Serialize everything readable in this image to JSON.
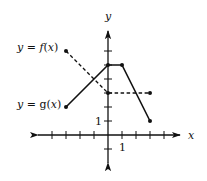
{
  "figure": {
    "axes": {
      "x_label": "x",
      "y_label": "y",
      "x_tick_label": "1",
      "y_tick_label": "1",
      "x_ticks": [
        -4,
        -3,
        -2,
        -1,
        1,
        2,
        3,
        4
      ],
      "y_ticks": [
        -1,
        1,
        2,
        3,
        4,
        5,
        6
      ],
      "x_range": [
        -5,
        6
      ],
      "y_range": [
        -2,
        7
      ]
    },
    "labels": {
      "f": "y = f(x)",
      "g": "y = g(x)"
    },
    "curves": {
      "f": {
        "style": "dashed",
        "points": [
          [
            -3,
            6
          ],
          [
            0,
            3
          ],
          [
            3,
            3
          ]
        ]
      },
      "g": {
        "style": "solid",
        "points": [
          [
            -3,
            2
          ],
          [
            0,
            5
          ],
          [
            1,
            5
          ],
          [
            3,
            1
          ]
        ]
      }
    },
    "intersections": [
      [
        -1,
        4
      ],
      [
        2,
        3
      ]
    ]
  }
}
